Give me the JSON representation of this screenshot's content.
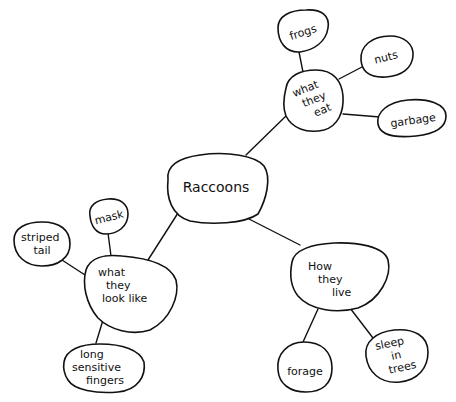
{
  "diagram": {
    "type": "mind-map",
    "colors": {
      "ink": "#111111",
      "background": "#ffffff"
    },
    "root": {
      "id": "raccoons",
      "label": "Raccoons"
    },
    "nodes": {
      "raccoons": {
        "lines": [
          "Raccoons"
        ]
      },
      "eat": {
        "lines": [
          "what",
          "they",
          "eat"
        ]
      },
      "frogs": {
        "lines": [
          "frogs"
        ]
      },
      "nuts": {
        "lines": [
          "nuts"
        ]
      },
      "garbage": {
        "lines": [
          "garbage"
        ]
      },
      "look": {
        "lines": [
          "what",
          "they",
          "look like"
        ]
      },
      "mask": {
        "lines": [
          "mask"
        ]
      },
      "striped": {
        "lines": [
          "striped",
          "tail"
        ]
      },
      "fingers": {
        "lines": [
          "long",
          "sensitive",
          "fingers"
        ]
      },
      "live": {
        "lines": [
          "How",
          "they",
          "live"
        ]
      },
      "forage": {
        "lines": [
          "forage"
        ]
      },
      "sleep": {
        "lines": [
          "sleep",
          "in",
          "trees"
        ]
      }
    },
    "edges": [
      [
        "raccoons",
        "eat"
      ],
      [
        "raccoons",
        "look"
      ],
      [
        "raccoons",
        "live"
      ],
      [
        "eat",
        "frogs"
      ],
      [
        "eat",
        "nuts"
      ],
      [
        "eat",
        "garbage"
      ],
      [
        "look",
        "mask"
      ],
      [
        "look",
        "striped"
      ],
      [
        "look",
        "fingers"
      ],
      [
        "live",
        "forage"
      ],
      [
        "live",
        "sleep"
      ]
    ]
  }
}
